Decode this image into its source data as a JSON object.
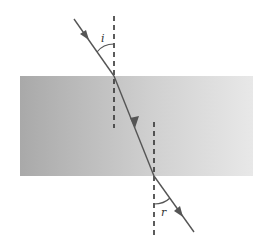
{
  "diagram": {
    "type": "refraction-through-slab",
    "labels": {
      "incidence_angle": "i",
      "refraction_angle": "r"
    },
    "colors": {
      "slab_left": "#a9a9a9",
      "slab_right": "#e6e6e6",
      "ray": "#555555",
      "normal": "#333333",
      "background": "#ffffff"
    }
  }
}
